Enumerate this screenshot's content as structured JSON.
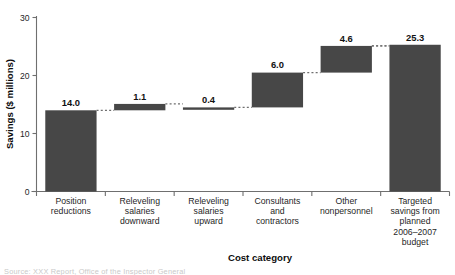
{
  "chart_data": {
    "type": "bar",
    "subtype": "waterfall",
    "title": "",
    "xlabel": "Cost category",
    "ylabel": "Savings ($ millions)",
    "ylim": [
      0,
      30
    ],
    "yticks": [
      0,
      10,
      20,
      30
    ],
    "ytick_labels": [
      "0",
      "10",
      "20",
      "30"
    ],
    "grid": false,
    "legend": null,
    "categories": [
      "Position reductions",
      "Releveling salaries downward",
      "Releveling salaries upward",
      "Consultants and contractors",
      "Other nonpersonnel",
      "Targeted savings from planned 2006–2007 budget"
    ],
    "category_lines": [
      [
        "Position",
        "reductions"
      ],
      [
        "Releveling",
        "salaries",
        "downward"
      ],
      [
        "Releveling",
        "salaries",
        "upward"
      ],
      [
        "Consultants",
        "and",
        "contractors"
      ],
      [
        "Other",
        "nonpersonnel"
      ],
      [
        "Targeted",
        "savings from",
        "planned",
        "2006–2007",
        "budget"
      ]
    ],
    "values": [
      14.0,
      1.1,
      0.4,
      6.0,
      4.6,
      25.3
    ],
    "value_labels": [
      "14.0",
      "1.1",
      "0.4",
      "6.0",
      "4.6",
      "25.3"
    ],
    "bar_bases": [
      0,
      14.0,
      14.1,
      14.5,
      20.5,
      0
    ],
    "bar_tops": [
      14.0,
      15.1,
      14.5,
      20.5,
      25.1,
      25.3
    ],
    "is_total": [
      false,
      false,
      false,
      false,
      false,
      true
    ],
    "bar_color": "#474747",
    "connector_color": "#6f6f6f",
    "axis_color": "#6f6f6f"
  },
  "footer": {
    "note": "Source:  XXX Report, Office of the Inspector General"
  }
}
